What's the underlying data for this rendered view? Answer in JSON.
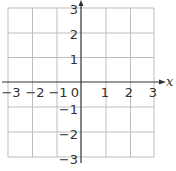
{
  "diagram": {
    "type": "coordinate-grid",
    "x_axis": {
      "label": "x",
      "range": [
        -3,
        3
      ],
      "ticks": [
        "−3",
        "−2",
        "−1",
        "0",
        "1",
        "2",
        "3"
      ]
    },
    "y_axis": {
      "label": "",
      "range": [
        -3,
        3
      ],
      "ticks_positive": [
        "3",
        "2",
        "1"
      ],
      "ticks_negative": [
        "−1",
        "−2",
        "−3"
      ]
    },
    "colors": {
      "grid": "#bdbdbd",
      "axis": "#333333",
      "text": "#333333"
    }
  }
}
